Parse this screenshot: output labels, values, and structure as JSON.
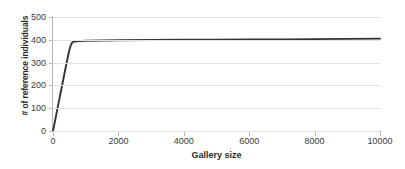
{
  "chart_data": {
    "type": "line",
    "title": "",
    "xlabel": "Gallery size",
    "ylabel": "# of reference individuals",
    "xlim": [
      0,
      10000
    ],
    "ylim": [
      0,
      500
    ],
    "grid": true,
    "legend": "none",
    "x_ticks": [
      0,
      2000,
      4000,
      6000,
      8000,
      10000
    ],
    "x_tick_labels": [
      "0",
      "2000",
      "4000",
      "6000",
      "8000",
      "10000"
    ],
    "y_ticks": [
      0,
      100,
      200,
      300,
      400,
      500
    ],
    "y_tick_labels": [
      "0",
      "100",
      "200",
      "300",
      "400",
      "500"
    ],
    "line_color": "#333333",
    "grid_color": "#e2e2e2",
    "axis_color": "#b6b6b6",
    "series": [
      {
        "name": "reference individuals",
        "color": "#333333",
        "x": [
          0,
          50,
          100,
          150,
          200,
          250,
          300,
          350,
          400,
          450,
          500,
          550,
          600,
          700,
          800,
          1000,
          1500,
          2000,
          3000,
          4000,
          5000,
          6000,
          7000,
          8000,
          9000,
          10000
        ],
        "y": [
          0,
          35,
          72,
          108,
          144,
          180,
          216,
          252,
          288,
          322,
          355,
          378,
          390,
          393,
          394,
          396,
          397,
          398,
          399,
          400,
          400,
          401,
          402,
          403,
          404,
          405
        ]
      }
    ]
  }
}
